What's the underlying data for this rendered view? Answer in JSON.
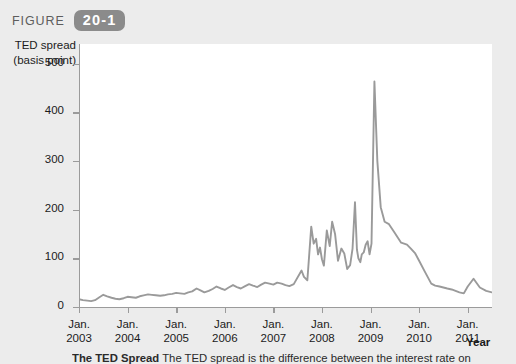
{
  "figure": {
    "label": "FIGURE",
    "number": "20-1"
  },
  "axes": {
    "y_title_line1": "TED spread",
    "y_title_line2": "(basis point)",
    "x_title": "Year"
  },
  "caption": {
    "bold_lead": "The TED Spread",
    "rest": "  The TED spread is the difference between the interest rate on"
  },
  "colors": {
    "line": "#9a9a9a",
    "axis": "#9b9b9b",
    "badge": "#8b8b8b",
    "page_background": "#ececec",
    "plot_background": "#ffffff"
  },
  "chart_data": {
    "type": "line",
    "title": "",
    "xlabel": "Year",
    "ylabel": "TED spread (basis point)",
    "ylim": [
      0,
      540
    ],
    "yticks": [
      0,
      100,
      200,
      300,
      400,
      500
    ],
    "ytick_labels": [
      "0",
      "100",
      "200",
      "300",
      "400",
      "500"
    ],
    "xlim": [
      2003.0,
      2011.5
    ],
    "xticks": [
      2003,
      2004,
      2005,
      2006,
      2007,
      2008,
      2009,
      2010,
      2011
    ],
    "xtick_labels": [
      [
        "Jan.",
        "2003"
      ],
      [
        "Jan.",
        "2004"
      ],
      [
        "Jan.",
        "2005"
      ],
      [
        "Jan.",
        "2006"
      ],
      [
        "Jan.",
        "2007"
      ],
      [
        "Jan.",
        "2008"
      ],
      [
        "Jan.",
        "2009"
      ],
      [
        "Jan.",
        "2010"
      ],
      [
        "Jan.",
        "2011"
      ]
    ],
    "grid": false,
    "legend": null,
    "series": [
      {
        "name": "TED spread",
        "x": [
          2003.0,
          2003.08,
          2003.17,
          2003.25,
          2003.33,
          2003.42,
          2003.5,
          2003.58,
          2003.67,
          2003.75,
          2003.83,
          2003.92,
          2004.0,
          2004.08,
          2004.17,
          2004.25,
          2004.33,
          2004.42,
          2004.5,
          2004.58,
          2004.67,
          2004.75,
          2004.83,
          2004.92,
          2005.0,
          2005.08,
          2005.17,
          2005.25,
          2005.33,
          2005.42,
          2005.5,
          2005.58,
          2005.67,
          2005.75,
          2005.83,
          2005.92,
          2006.0,
          2006.08,
          2006.17,
          2006.25,
          2006.33,
          2006.42,
          2006.5,
          2006.58,
          2006.67,
          2006.75,
          2006.83,
          2006.92,
          2007.0,
          2007.08,
          2007.17,
          2007.25,
          2007.33,
          2007.42,
          2007.58,
          2007.63,
          2007.7,
          2007.78,
          2007.83,
          2007.88,
          2007.92,
          2007.96,
          2008.0,
          2008.04,
          2008.1,
          2008.16,
          2008.21,
          2008.27,
          2008.33,
          2008.4,
          2008.46,
          2008.52,
          2008.58,
          2008.63,
          2008.68,
          2008.72,
          2008.75,
          2008.79,
          2008.82,
          2008.86,
          2008.9,
          2008.94,
          2008.98,
          2009.02,
          2009.08,
          2009.14,
          2009.21,
          2009.29,
          2009.38,
          2009.5,
          2009.63,
          2009.75,
          2009.83,
          2009.92,
          2010.0,
          2010.12,
          2010.25,
          2010.33,
          2010.42,
          2010.5,
          2010.58,
          2010.67,
          2010.75,
          2010.83,
          2010.92,
          2011.0,
          2011.12,
          2011.25,
          2011.38,
          2011.5
        ],
        "y": [
          16,
          14,
          13,
          12,
          14,
          20,
          25,
          22,
          19,
          17,
          16,
          18,
          21,
          20,
          19,
          22,
          24,
          26,
          25,
          24,
          23,
          24,
          26,
          27,
          29,
          28,
          27,
          30,
          32,
          38,
          34,
          30,
          33,
          37,
          42,
          38,
          35,
          40,
          45,
          41,
          38,
          43,
          47,
          44,
          41,
          46,
          50,
          48,
          46,
          50,
          48,
          45,
          43,
          47,
          75,
          62,
          55,
          165,
          130,
          140,
          108,
          122,
          98,
          85,
          157,
          125,
          175,
          150,
          95,
          120,
          110,
          78,
          86,
          120,
          215,
          118,
          100,
          92,
          108,
          112,
          128,
          135,
          108,
          130,
          463,
          300,
          205,
          175,
          170,
          152,
          132,
          128,
          120,
          110,
          95,
          72,
          48,
          44,
          42,
          40,
          38,
          36,
          33,
          30,
          28,
          42,
          58,
          40,
          33,
          30
        ]
      }
    ],
    "annotations": [
      {
        "text": "peak",
        "x": 2009.08,
        "y": 463
      }
    ]
  }
}
